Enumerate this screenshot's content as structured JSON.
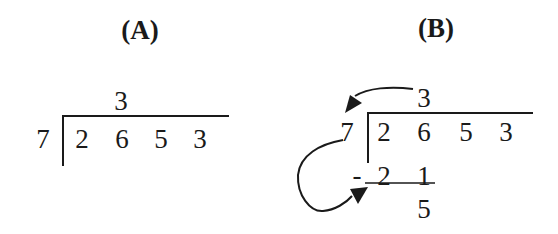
{
  "panels": [
    {
      "label": "(A)",
      "divisor": "7",
      "quotient": "3",
      "dividend_digits": [
        "2",
        "6",
        "5",
        "3"
      ]
    },
    {
      "label": "(B)",
      "divisor": "7",
      "quotient": "3",
      "dividend_digits": [
        "2",
        "6",
        "5",
        "3"
      ],
      "subtraction_sign": "-",
      "product_digits": [
        "2",
        "1"
      ],
      "remainder": "5"
    }
  ],
  "colors": {
    "ink": "#1a1a1a",
    "background": "#ffffff"
  }
}
